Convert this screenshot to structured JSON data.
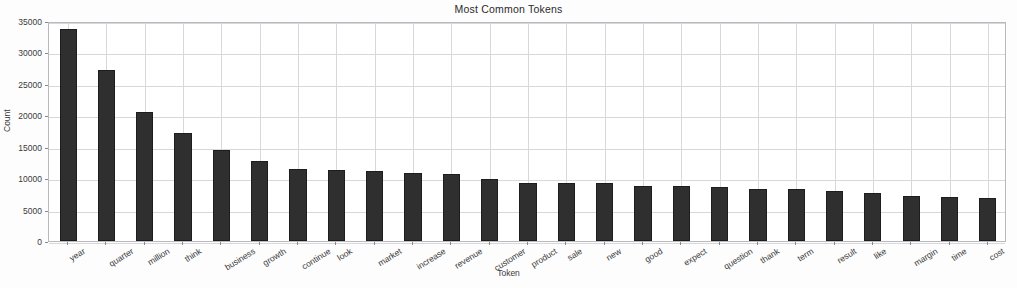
{
  "chart_data": {
    "type": "bar",
    "title": "Most Common Tokens",
    "xlabel": "Token",
    "ylabel": "Count",
    "ylim": [
      0,
      35000
    ],
    "yticks": [
      0,
      5000,
      10000,
      15000,
      20000,
      25000,
      30000,
      35000
    ],
    "ytick_labels": [
      "0",
      "5000",
      "10000",
      "15000",
      "20000",
      "25000",
      "30000",
      "35000"
    ],
    "grid": true,
    "legend": null,
    "bar_color": "#2f2f2f",
    "categories": [
      "year",
      "quarter",
      "million",
      "think",
      "business",
      "growth",
      "continue",
      "look",
      "market",
      "increase",
      "revenue",
      "customer",
      "product",
      "sale",
      "new",
      "good",
      "expect",
      "question",
      "thank",
      "term",
      "result",
      "like",
      "margin",
      "time",
      "cost"
    ],
    "values": [
      33700,
      27200,
      20500,
      17200,
      14500,
      12800,
      11500,
      11300,
      11200,
      10900,
      10700,
      9900,
      9300,
      9300,
      9200,
      8800,
      8800,
      8600,
      8200,
      8200,
      7900,
      7700,
      7100,
      7000,
      6800
    ]
  },
  "axis": {
    "ylabel": "Count",
    "xlabel": "Token"
  }
}
